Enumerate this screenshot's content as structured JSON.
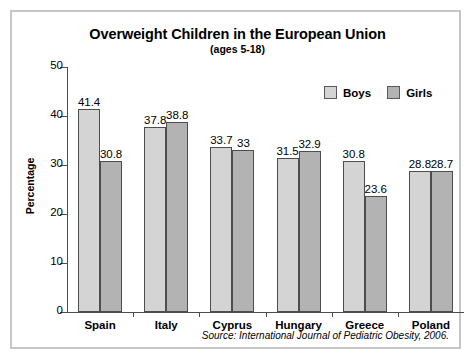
{
  "chart_data": {
    "type": "bar",
    "title": "Overweight Children in the European Union",
    "subtitle": "(ages 5-18)",
    "xlabel": "",
    "ylabel": "Percentage",
    "ylim": [
      0,
      50
    ],
    "yticks": [
      0,
      10,
      20,
      30,
      40,
      50
    ],
    "ytick_labels": [
      "0",
      "10",
      "20",
      "30",
      "40",
      "50"
    ],
    "grid": false,
    "legend_position": "top-right",
    "categories": [
      "Spain",
      "Italy",
      "Cyprus",
      "Hungary",
      "Greece",
      "Poland"
    ],
    "series": [
      {
        "name": "Boys",
        "color": "#d4d4d4",
        "values": [
          41.4,
          37.8,
          33.7,
          31.5,
          30.8,
          28.8
        ],
        "labels": [
          "41.4",
          "37.8",
          "33.7",
          "31.5",
          "30.8",
          "28.8"
        ]
      },
      {
        "name": "Girls",
        "color": "#b3b3b3",
        "values": [
          30.8,
          38.8,
          33,
          32.9,
          23.6,
          28.7
        ],
        "labels": [
          "30.8",
          "38.8",
          "33",
          "32.9",
          "23.6",
          "28.7"
        ]
      }
    ],
    "source": "Source: International Journal of Pediatric Obesity, 2006."
  },
  "legend": {
    "entries": [
      {
        "label": "Boys"
      },
      {
        "label": "Girls"
      }
    ]
  }
}
